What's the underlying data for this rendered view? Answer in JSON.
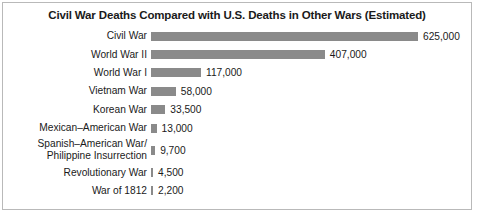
{
  "chart_data": {
    "type": "bar",
    "orientation": "horizontal",
    "title": "Civil War Deaths Compared with U.S. Deaths in Other Wars (Estimated)",
    "xlabel": "",
    "ylabel": "",
    "grid": false,
    "legend": false,
    "xlim": [
      0,
      625000
    ],
    "categories": [
      "Civil War",
      "World War II",
      "World War I",
      "Vietnam War",
      "Korean War",
      "Mexican–American War",
      "Spanish–American War/\nPhilippine Insurrection",
      "Revolutionary War",
      "War of 1812"
    ],
    "values": [
      625000,
      407000,
      117000,
      58000,
      33500,
      13000,
      9700,
      4500,
      2200
    ],
    "value_labels": [
      "625,000",
      "407,000",
      "117,000",
      "58,000",
      "33,500",
      "13,000",
      "9,700",
      "4,500",
      "2,200"
    ],
    "bar_color": "#8a8a8a",
    "background_color": "#ffffff",
    "border_color": "#b9b9b9",
    "text_color": "#1a1a1a"
  }
}
